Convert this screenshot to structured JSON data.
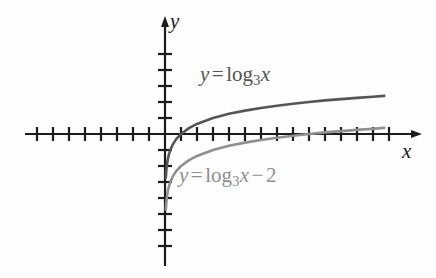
{
  "figure": {
    "background_color": "#fdfdfd",
    "width": 436,
    "height": 278
  },
  "axes": {
    "x_label": "x",
    "y_label": "y",
    "axis_color": "#1c1c1c",
    "origin_px": {
      "x": 165,
      "y": 134
    },
    "tick_spacing_px": 16,
    "x_axis": {
      "start_px": 25,
      "end_px": 420,
      "arrow": true,
      "ticks_left_of_origin": 8,
      "ticks_right_of_origin": 14
    },
    "y_axis": {
      "top_px": 18,
      "bottom_px": 266,
      "arrow": true,
      "ticks_above_origin": 5,
      "ticks_below_origin": 7
    }
  },
  "curves": [
    {
      "name": "log3x",
      "label": "y = log_3 x",
      "label_parts": {
        "variable": "y",
        "equals": "=",
        "function": "log",
        "base": "3",
        "argument": "x"
      },
      "color": "#555555",
      "stroke_width": 2.6,
      "x_intercept": 1,
      "vertical_asymptote": 0,
      "domain_units": [
        0.05,
        13.7
      ]
    },
    {
      "name": "log3x-minus-2",
      "label": "y = log_3 x - 2",
      "label_parts": {
        "variable": "y",
        "equals": "=",
        "function": "log",
        "base": "3",
        "argument": "x",
        "operator": "−",
        "constant": "2"
      },
      "color": "#8f8f8f",
      "stroke_width": 2.6,
      "x_intercept": 9,
      "vertical_asymptote": 0,
      "domain_units": [
        0.05,
        13.7
      ]
    }
  ],
  "chart_data": {
    "type": "line",
    "title": "",
    "xlabel": "x",
    "ylabel": "y",
    "xlim": [
      -8.75,
      15.9
    ],
    "ylim": [
      -8.25,
      7.25
    ],
    "grid": false,
    "legend": "inline-annotations",
    "tick_step": 1,
    "series": [
      {
        "name": "y = log_3 x",
        "color": "#555555",
        "x": [
          0.05,
          0.08,
          0.12,
          0.18,
          0.25,
          0.35,
          0.5,
          0.7,
          1,
          1.5,
          2,
          3,
          4,
          5,
          6,
          7,
          8,
          9,
          10,
          11,
          12,
          13,
          13.7
        ],
        "y": [
          -2.73,
          -2.3,
          -1.93,
          -1.56,
          -1.26,
          -0.96,
          -0.63,
          -0.32,
          0,
          0.37,
          0.63,
          1,
          1.26,
          1.46,
          1.63,
          1.77,
          1.89,
          2,
          2.1,
          2.18,
          2.26,
          2.33,
          2.38
        ]
      },
      {
        "name": "y = log_3 x - 2",
        "color": "#8f8f8f",
        "x": [
          0.05,
          0.08,
          0.12,
          0.18,
          0.25,
          0.35,
          0.5,
          0.7,
          1,
          1.5,
          2,
          3,
          4,
          5,
          6,
          7,
          8,
          9,
          10,
          11,
          12,
          13,
          13.7
        ],
        "y": [
          -4.73,
          -4.3,
          -3.93,
          -3.56,
          -3.26,
          -2.96,
          -2.63,
          -2.32,
          -2,
          -1.63,
          -1.37,
          -1,
          -0.74,
          -0.54,
          -0.37,
          -0.23,
          -0.11,
          0,
          0.1,
          0.18,
          0.26,
          0.33,
          0.38
        ]
      }
    ],
    "annotations": [
      {
        "text": "y = log_3 x",
        "x": 2.2,
        "y": 3.5,
        "color": "#555555"
      },
      {
        "text": "y = log_3 x - 2",
        "x": 0.9,
        "y": -2.8,
        "color": "#8f8f8f"
      }
    ]
  }
}
